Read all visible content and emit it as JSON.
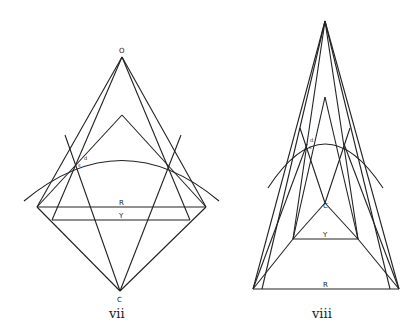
{
  "figures": [
    {
      "id": "vii",
      "caption": "vii",
      "labels": {
        "apex": "O",
        "bottom": "C",
        "outer_base": "R",
        "inner_base": "Y",
        "point_d": "d",
        "point_s": "s"
      }
    },
    {
      "id": "viii",
      "caption": "viii",
      "labels": {
        "bottom": "C",
        "outer_base": "R",
        "inner_base": "Y",
        "point_d": "d",
        "point_s": "s"
      }
    }
  ]
}
